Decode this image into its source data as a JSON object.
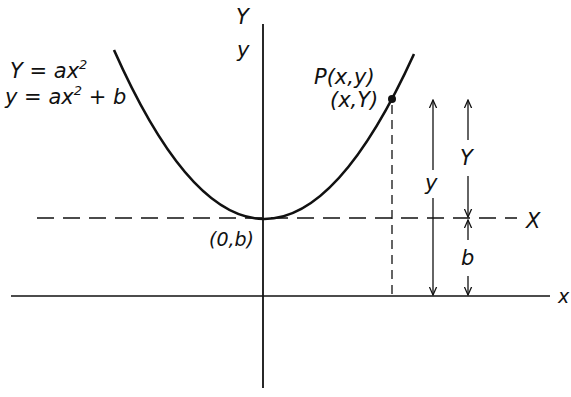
{
  "diagram": {
    "colors": {
      "ink": "#111111",
      "background": "#ffffff"
    },
    "equations": {
      "translated": {
        "lhs": "Y",
        "rhs": "ax",
        "exp": "2",
        "tail": ""
      },
      "original": {
        "lhs": "y",
        "rhs": "ax",
        "exp": "2",
        "tail": " + b"
      }
    },
    "axes": {
      "upper_y_label": "Y",
      "lower_y_label": "y",
      "new_x_label": "X",
      "old_x_label": "x"
    },
    "point": {
      "label_original": "P(x,y)",
      "label_translated": "(x,Y)"
    },
    "vertex_label": "(0,b)",
    "dimensions": {
      "full_height_label": "y",
      "upper_height_label": "Y",
      "offset_label": "b"
    }
  }
}
